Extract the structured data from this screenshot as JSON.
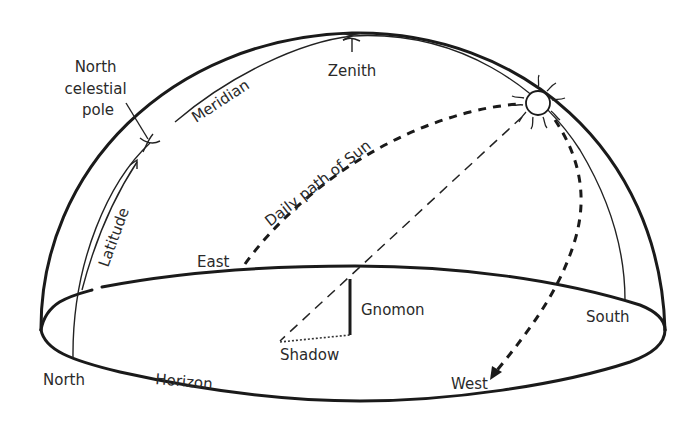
{
  "diagram": {
    "type": "celestial sphere / sundial schematic",
    "colors": {
      "background": "#ffffff",
      "ink": "#1a1a1a",
      "text": "#2a2a2a"
    },
    "labels": {
      "north_celestial_pole_line1": "North",
      "north_celestial_pole_line2": "celestial",
      "north_celestial_pole_line3": "pole",
      "meridian": "Meridian",
      "zenith": "Zenith",
      "daily_path": "Daily path of Sun",
      "latitude": "Latitude",
      "east": "East",
      "gnomon": "Gnomon",
      "shadow": "Shadow",
      "south": "South",
      "north": "North",
      "horizon": "Horizon",
      "west": "West"
    },
    "elements": [
      "dome-outline",
      "horizon-ellipse",
      "meridian-arc",
      "latitude-arrow",
      "north-celestial-pole-marker",
      "zenith-marker",
      "sun-icon",
      "daily-path-of-sun",
      "sun-ray",
      "gnomon",
      "shadow",
      "west-arrow"
    ]
  }
}
